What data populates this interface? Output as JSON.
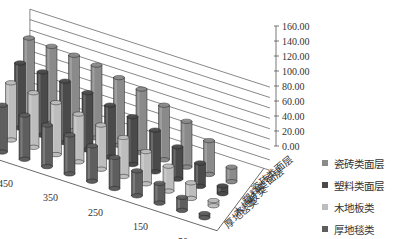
{
  "chart_data": {
    "type": "bar",
    "subtype": "3d-cylinder-column",
    "title": "",
    "xlabel": "",
    "ylabel": "",
    "ylim": [
      0,
      160
    ],
    "y_ticks": [
      "0.00",
      "20.00",
      "40.00",
      "60.00",
      "80.00",
      "100.00",
      "120.00",
      "140.00",
      "160.00"
    ],
    "categories": [
      "500",
      "450",
      "400",
      "350",
      "300",
      "250",
      "200",
      "150",
      "100",
      "50"
    ],
    "x_tick_labels": [
      "450",
      "350",
      "250",
      "150",
      "50"
    ],
    "depth_labels": [
      "厚地毯类",
      "木地板类",
      "塑料类面层",
      "瓷砖类面层"
    ],
    "grid": true,
    "legend_position": "right",
    "series": [
      {
        "name": "瓷砖类面层",
        "color": "#8a8a8a",
        "values": [
          150,
          148,
          145,
          140,
          130,
          122,
          105,
          88,
          65,
          28
        ]
      },
      {
        "name": "塑料类面层",
        "color": "#4a4a4a",
        "values": [
          125,
          122,
          118,
          110,
          100,
          92,
          80,
          62,
          45,
          15
        ]
      },
      {
        "name": "木地板类",
        "color": "#bdbdbd",
        "values": [
          110,
          105,
          100,
          92,
          85,
          75,
          62,
          48,
          30,
          10
        ]
      },
      {
        "name": "厚地毯类",
        "color": "#5e5e5e",
        "values": [
          90,
          85,
          80,
          75,
          68,
          60,
          48,
          38,
          25,
          8
        ]
      }
    ]
  },
  "legend": {
    "items": [
      {
        "label": "瓷砖类面层",
        "color": "#8a8a8a"
      },
      {
        "label": "塑料类面层",
        "color": "#4a4a4a"
      },
      {
        "label": "木地板类",
        "color": "#bdbdbd"
      },
      {
        "label": "厚地毯类",
        "color": "#5e5e5e"
      }
    ]
  }
}
